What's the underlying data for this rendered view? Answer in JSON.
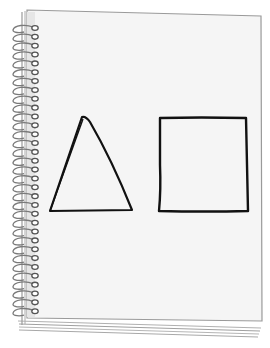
{
  "illustration": {
    "subject": "spiral notebook",
    "colors": {
      "background": "#ffffff",
      "page": "#f4f4f4",
      "page_edge": "#9a9a9a",
      "spiral": "#7a7a7a",
      "ink": "#111111"
    },
    "spiral": {
      "ring_count": 33,
      "first_y": 27,
      "spacing": 8.85
    },
    "shapes": [
      {
        "name": "triangle",
        "points": [
          [
            83,
            118
          ],
          [
            132,
            210
          ],
          [
            50,
            211
          ]
        ]
      },
      {
        "name": "square",
        "points": [
          [
            160,
            117
          ],
          [
            247,
            118
          ],
          [
            248,
            212
          ],
          [
            159,
            211
          ]
        ]
      }
    ]
  }
}
